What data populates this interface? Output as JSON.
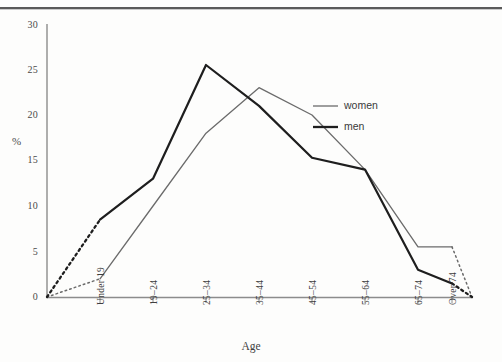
{
  "figure": {
    "axis_title_x": "Age",
    "axis_title_y": "%"
  },
  "legend": {
    "position": "inside-right",
    "entries": [
      {
        "label": "women",
        "style": "thin-line",
        "color": "#6b6b6b"
      },
      {
        "label": "men",
        "style": "thick-line",
        "color": "#1e1e1e"
      }
    ]
  },
  "yaxis": {
    "ticks": [
      "0",
      "5",
      "10",
      "15",
      "20",
      "25",
      "30"
    ]
  },
  "xaxis": {
    "categories": [
      "Under 19",
      "19–24",
      "25–34",
      "35–44",
      "45–54",
      "55–64",
      "65–74",
      "Over 74"
    ]
  },
  "chart_data": {
    "type": "line",
    "title": "",
    "xlabel": "Age",
    "ylabel": "%",
    "categories": [
      "Under 19",
      "19–24",
      "25–34",
      "35–44",
      "45–54",
      "55–64",
      "65–74",
      "Over 74"
    ],
    "series": [
      {
        "name": "women",
        "values": [
          2,
          10,
          18,
          23,
          20,
          14,
          5.5,
          5.5
        ]
      },
      {
        "name": "men",
        "values": [
          8.5,
          13,
          25.5,
          21,
          15.3,
          14,
          3,
          1.5
        ]
      }
    ],
    "ylim": [
      0,
      30
    ],
    "ytick_step": 5,
    "grid": false,
    "legend_position": "inside-right",
    "annotations": [
      "dotted extension from origin (0,0) to the first category for both series",
      "dotted extension from the Over 74 category down to 0 at the right edge for both series"
    ]
  },
  "colors": {
    "women_line": "#6b6b6b",
    "men_line": "#1e1e1e",
    "axis": "#8c8c8c",
    "top_rule": "#5a5a5a"
  }
}
